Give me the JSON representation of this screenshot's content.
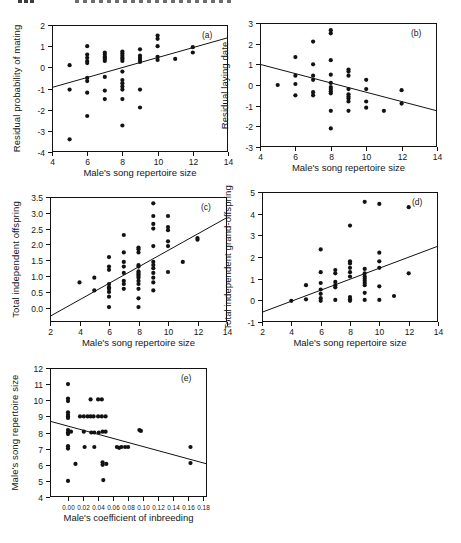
{
  "page": {
    "background": "#ffffff",
    "ink": "#121212"
  },
  "header": {
    "note_page_number_cropped": "",
    "note_running_head_cropped": ""
  },
  "chart_data": [
    {
      "id": "a",
      "type": "scatter",
      "panel_label": "(a)",
      "xlabel": "Male's song repertoire size",
      "ylabel": "Residual probability of mating",
      "xlim": [
        4,
        14
      ],
      "ylim": [
        -4,
        2
      ],
      "xticks": {
        "values": [
          4,
          6,
          8,
          10,
          12,
          14
        ],
        "labels": [
          "4",
          "6",
          "8",
          "10",
          "12",
          "14"
        ]
      },
      "yticks": {
        "values": [
          2,
          1,
          0,
          -1,
          -2,
          -3,
          -4
        ],
        "labels": [
          "2",
          "1",
          "0",
          "-1",
          "-2",
          "-3",
          "-4"
        ]
      },
      "grid": false,
      "legend": false,
      "trend": [
        [
          4,
          -0.95
        ],
        [
          14,
          1.4
        ]
      ],
      "points": [
        [
          5,
          0.1
        ],
        [
          5,
          -1.05
        ],
        [
          5,
          -3.4
        ],
        [
          6,
          1.0
        ],
        [
          6,
          0.6
        ],
        [
          6,
          0.45
        ],
        [
          6,
          0.3
        ],
        [
          6,
          0.2
        ],
        [
          6,
          -0.5
        ],
        [
          6,
          -0.65
        ],
        [
          6,
          -1.2
        ],
        [
          6,
          -2.3
        ],
        [
          7,
          0.7
        ],
        [
          7,
          0.6
        ],
        [
          7,
          0.5
        ],
        [
          7,
          0.45
        ],
        [
          7,
          0.4
        ],
        [
          7,
          0.3
        ],
        [
          7,
          -0.45
        ],
        [
          7,
          -1.1
        ],
        [
          7,
          -1.5
        ],
        [
          8,
          0.75
        ],
        [
          8,
          0.65
        ],
        [
          8,
          0.55
        ],
        [
          8,
          0.45
        ],
        [
          8,
          0.4
        ],
        [
          8,
          0.3
        ],
        [
          8,
          -0.2
        ],
        [
          8,
          -0.6
        ],
        [
          8,
          -0.75
        ],
        [
          8,
          -0.9
        ],
        [
          8,
          -1.05
        ],
        [
          8,
          -1.5
        ],
        [
          8,
          -2.75
        ],
        [
          9,
          0.85
        ],
        [
          9,
          0.55
        ],
        [
          9,
          0.45
        ],
        [
          9,
          0.35
        ],
        [
          9,
          0.25
        ],
        [
          9,
          -1.05
        ],
        [
          9,
          -1.9
        ],
        [
          10,
          1.5
        ],
        [
          10,
          1.35
        ],
        [
          10,
          1.0
        ],
        [
          10,
          0.5
        ],
        [
          10,
          0.35
        ],
        [
          11,
          0.4
        ],
        [
          12,
          0.95
        ],
        [
          12,
          0.7
        ]
      ],
      "layout": {
        "box_left": 52,
        "box_top": 25,
        "box_width": 176,
        "box_height": 127,
        "xtick_font": 8.5
      }
    },
    {
      "id": "b",
      "type": "scatter",
      "panel_label": "(b)",
      "xlabel": "Male's song repertoire size",
      "ylabel": "Residual laying date",
      "xlim": [
        4,
        14
      ],
      "ylim": [
        -3,
        3
      ],
      "xticks": {
        "values": [
          4,
          6,
          8,
          10,
          12,
          14
        ],
        "labels": [
          "4",
          "6",
          "8",
          "10",
          "12",
          "14"
        ]
      },
      "yticks": {
        "values": [
          3,
          2,
          1,
          0,
          -1,
          -2,
          -3
        ],
        "labels": [
          "3",
          "2",
          "1",
          "0",
          "-1",
          "-2",
          "-3"
        ]
      },
      "grid": false,
      "legend": false,
      "trend": [
        [
          4,
          1.0
        ],
        [
          14,
          -1.25
        ]
      ],
      "points": [
        [
          5,
          0.0
        ],
        [
          6,
          1.35
        ],
        [
          6,
          0.45
        ],
        [
          6,
          0.05
        ],
        [
          6,
          -0.5
        ],
        [
          7,
          2.1
        ],
        [
          7,
          1.0
        ],
        [
          7,
          0.45
        ],
        [
          7,
          0.25
        ],
        [
          7,
          -0.35
        ],
        [
          7,
          -0.5
        ],
        [
          8,
          2.65
        ],
        [
          8,
          2.5
        ],
        [
          8,
          1.2
        ],
        [
          8,
          0.5
        ],
        [
          8,
          0.1
        ],
        [
          8,
          -0.1
        ],
        [
          8,
          -0.2
        ],
        [
          8,
          -0.3
        ],
        [
          8,
          -0.4
        ],
        [
          8,
          -1.25
        ],
        [
          8,
          -2.1
        ],
        [
          9,
          0.75
        ],
        [
          9,
          0.65
        ],
        [
          9,
          0.45
        ],
        [
          9,
          -0.2
        ],
        [
          9,
          -0.45
        ],
        [
          9,
          -0.55
        ],
        [
          9,
          -0.65
        ],
        [
          9,
          -0.8
        ],
        [
          9,
          -1.25
        ],
        [
          10,
          0.25
        ],
        [
          10,
          -0.2
        ],
        [
          10,
          -0.8
        ],
        [
          10,
          -1.1
        ],
        [
          11,
          -1.25
        ],
        [
          12,
          -0.25
        ],
        [
          12,
          -0.9
        ]
      ],
      "layout": {
        "box_left": 260,
        "box_top": 23,
        "box_width": 177,
        "box_height": 124,
        "xtick_font": 8.5
      }
    },
    {
      "id": "c",
      "type": "scatter",
      "panel_label": "(c)",
      "xlabel": "Male's song repertoire size",
      "ylabel": "Total independent offspring",
      "xlim": [
        2,
        14
      ],
      "ylim": [
        -0.45,
        3.5
      ],
      "xticks": {
        "values": [
          2,
          4,
          6,
          8,
          10,
          12,
          14
        ],
        "labels": [
          "2",
          "4",
          "6",
          "8",
          "10",
          "12",
          "14"
        ]
      },
      "yticks": {
        "values": [
          3.5,
          3.0,
          2.5,
          2.0,
          1.5,
          1.0,
          0.5,
          0.0
        ],
        "labels": [
          "3.5",
          "3.0",
          "2.5",
          "2.0",
          "1.5",
          "1.0",
          "0.5",
          "0.0"
        ]
      },
      "grid": false,
      "legend": false,
      "trend": [
        [
          2,
          -0.27
        ],
        [
          14,
          2.85
        ]
      ],
      "points": [
        [
          4,
          0.8
        ],
        [
          5,
          0.95
        ],
        [
          5,
          0.55
        ],
        [
          6,
          1.6
        ],
        [
          6,
          1.3
        ],
        [
          6,
          1.2
        ],
        [
          6,
          0.75
        ],
        [
          6,
          0.65
        ],
        [
          6,
          0.6
        ],
        [
          6,
          0.5
        ],
        [
          6,
          0.35
        ],
        [
          6,
          0.02
        ],
        [
          7,
          2.3
        ],
        [
          7,
          1.75
        ],
        [
          7,
          1.45
        ],
        [
          7,
          1.3
        ],
        [
          7,
          1.1
        ],
        [
          7,
          0.85
        ],
        [
          7,
          0.75
        ],
        [
          7,
          0.6
        ],
        [
          8,
          1.9
        ],
        [
          8,
          1.85
        ],
        [
          8,
          1.75
        ],
        [
          8,
          1.35
        ],
        [
          8,
          1.3
        ],
        [
          8,
          1.15
        ],
        [
          8,
          1.1
        ],
        [
          8,
          1.05
        ],
        [
          8,
          1.0
        ],
        [
          8,
          0.95
        ],
        [
          8,
          0.85
        ],
        [
          8,
          0.75
        ],
        [
          8,
          0.6
        ],
        [
          8,
          0.3
        ],
        [
          8,
          0.02
        ],
        [
          9,
          3.3
        ],
        [
          9,
          2.9
        ],
        [
          9,
          2.65
        ],
        [
          9,
          2.5
        ],
        [
          9,
          1.95
        ],
        [
          9,
          1.45
        ],
        [
          9,
          1.35
        ],
        [
          9,
          1.25
        ],
        [
          9,
          1.1
        ],
        [
          9,
          0.95
        ],
        [
          9,
          0.8
        ],
        [
          9,
          0.55
        ],
        [
          10,
          2.9
        ],
        [
          10,
          2.55
        ],
        [
          10,
          2.45
        ],
        [
          10,
          2.1
        ],
        [
          10,
          1.95
        ],
        [
          10,
          1.13
        ],
        [
          11,
          1.45
        ],
        [
          12,
          2.2
        ],
        [
          12,
          2.15
        ]
      ],
      "layout": {
        "box_left": 50,
        "box_top": 197,
        "box_width": 177,
        "box_height": 125,
        "xtick_font": 8.5
      }
    },
    {
      "id": "d",
      "type": "scatter",
      "panel_label": "(d)",
      "xlabel": "Male's song repertoire size",
      "ylabel": "Total independent grand-offspring",
      "xlim": [
        2,
        14
      ],
      "ylim": [
        -1,
        5
      ],
      "xticks": {
        "values": [
          2,
          4,
          6,
          8,
          10,
          12,
          14
        ],
        "labels": [
          "2",
          "4",
          "6",
          "8",
          "10",
          "12",
          "14"
        ]
      },
      "yticks": {
        "values": [
          5,
          4,
          3,
          2,
          1,
          0,
          -1
        ],
        "labels": [
          "5",
          "4",
          "3",
          "2",
          "1",
          "0",
          "-1"
        ]
      },
      "grid": false,
      "legend": false,
      "trend": [
        [
          2,
          -0.55
        ],
        [
          14,
          2.5
        ]
      ],
      "points": [
        [
          4,
          -0.02
        ],
        [
          5,
          0.7
        ],
        [
          5,
          0.05
        ],
        [
          6,
          2.35
        ],
        [
          6,
          1.3
        ],
        [
          6,
          0.8
        ],
        [
          6,
          0.5
        ],
        [
          6,
          0.3
        ],
        [
          6,
          0.1
        ],
        [
          6,
          -0.02
        ],
        [
          7,
          1.4
        ],
        [
          7,
          1.25
        ],
        [
          7,
          0.85
        ],
        [
          7,
          0.7
        ],
        [
          7,
          0.6
        ],
        [
          7,
          0.02
        ],
        [
          8,
          3.45
        ],
        [
          8,
          1.8
        ],
        [
          8,
          1.7
        ],
        [
          8,
          1.5
        ],
        [
          8,
          1.3
        ],
        [
          8,
          1.1
        ],
        [
          8,
          0.15
        ],
        [
          8,
          0.05
        ],
        [
          8,
          -0.02
        ],
        [
          9,
          4.55
        ],
        [
          9,
          1.45
        ],
        [
          9,
          1.25
        ],
        [
          9,
          1.1
        ],
        [
          9,
          1.0
        ],
        [
          9,
          0.9
        ],
        [
          9,
          0.8
        ],
        [
          9,
          0.7
        ],
        [
          9,
          0.35
        ],
        [
          9,
          0.02
        ],
        [
          10,
          4.45
        ],
        [
          10,
          2.2
        ],
        [
          10,
          1.8
        ],
        [
          10,
          1.5
        ],
        [
          10,
          0.65
        ],
        [
          10,
          0.02
        ],
        [
          11,
          0.2
        ],
        [
          12,
          4.3
        ],
        [
          12,
          1.25
        ]
      ],
      "layout": {
        "box_left": 262,
        "box_top": 192,
        "box_width": 176,
        "box_height": 130,
        "xtick_font": 8.5
      }
    },
    {
      "id": "e",
      "type": "scatter",
      "panel_label": "(e)",
      "xlabel": "Male's coefficient of inbreeding",
      "ylabel": "Male's song repertoire size",
      "xlim": [
        -0.024,
        0.185
      ],
      "ylim": [
        4,
        12
      ],
      "xticks": {
        "values": [
          0.0,
          0.02,
          0.04,
          0.06,
          0.08,
          0.1,
          0.12,
          0.14,
          0.16,
          0.18
        ],
        "labels": [
          "0.00",
          "0.02",
          "0.04",
          "0.06",
          "0.08",
          "0.10",
          "0.12",
          "0.14",
          "0.16",
          "0.18"
        ]
      },
      "yticks": {
        "values": [
          12,
          11,
          10,
          9,
          8,
          7,
          6,
          5,
          4
        ],
        "labels": [
          "12",
          "11",
          "10",
          "9",
          "8",
          "7",
          "6",
          "5",
          "4"
        ]
      },
      "grid": false,
      "legend": false,
      "trend": [
        [
          -0.024,
          8.7
        ],
        [
          0.185,
          6.05
        ]
      ],
      "points": [
        [
          0.0,
          11.0
        ],
        [
          0.0,
          10.1
        ],
        [
          0.0,
          9.95
        ],
        [
          0.0,
          9.25
        ],
        [
          0.0,
          9.1
        ],
        [
          0.0,
          9.0
        ],
        [
          0.0,
          8.9
        ],
        [
          0.0,
          8.15
        ],
        [
          0.0,
          8.0
        ],
        [
          0.0,
          7.9
        ],
        [
          0.0,
          7.15
        ],
        [
          0.0,
          7.0
        ],
        [
          0.0,
          5.0
        ],
        [
          0.004,
          8.05
        ],
        [
          0.01,
          6.05
        ],
        [
          0.016,
          9.0
        ],
        [
          0.021,
          9.0
        ],
        [
          0.021,
          8.05
        ],
        [
          0.022,
          7.1
        ],
        [
          0.026,
          9.0
        ],
        [
          0.03,
          10.05
        ],
        [
          0.03,
          9.0
        ],
        [
          0.031,
          8.0
        ],
        [
          0.034,
          9.0
        ],
        [
          0.035,
          8.0
        ],
        [
          0.035,
          7.1
        ],
        [
          0.04,
          10.05
        ],
        [
          0.04,
          9.0
        ],
        [
          0.041,
          8.0
        ],
        [
          0.045,
          10.05
        ],
        [
          0.045,
          9.0
        ],
        [
          0.046,
          8.05
        ],
        [
          0.046,
          6.15
        ],
        [
          0.046,
          6.0
        ],
        [
          0.047,
          5.05
        ],
        [
          0.05,
          9.0
        ],
        [
          0.05,
          8.05
        ],
        [
          0.051,
          6.05
        ],
        [
          0.065,
          7.1
        ],
        [
          0.068,
          7.05
        ],
        [
          0.071,
          7.1
        ],
        [
          0.076,
          7.1
        ],
        [
          0.08,
          7.1
        ],
        [
          0.095,
          8.15
        ],
        [
          0.097,
          8.1
        ],
        [
          0.163,
          7.1
        ],
        [
          0.163,
          6.1
        ]
      ],
      "layout": {
        "box_left": 50,
        "box_top": 368,
        "box_width": 157,
        "box_height": 129,
        "xtick_font": 6.4
      }
    }
  ]
}
